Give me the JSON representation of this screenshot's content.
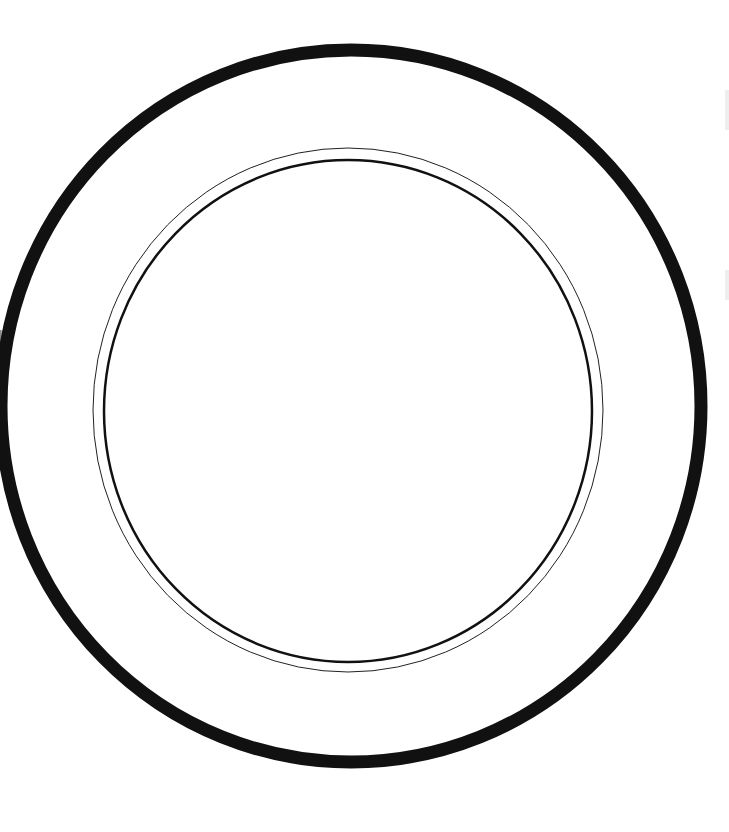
{
  "image": {
    "subject": "plate outline drawing",
    "background": "#ffffff",
    "stroke_color": "#111111"
  },
  "plate": {
    "outer_rim": {
      "cx": 351,
      "cy": 406,
      "rx": 350,
      "ry": 356,
      "stroke_width": 13
    },
    "well_thin_ring": {
      "cx": 348,
      "cy": 410,
      "rx": 255,
      "ry": 262,
      "stroke_width": 1
    },
    "well_inner_ring": {
      "cx": 348,
      "cy": 411,
      "rx": 244,
      "ry": 251,
      "stroke_width": 2.5
    }
  }
}
